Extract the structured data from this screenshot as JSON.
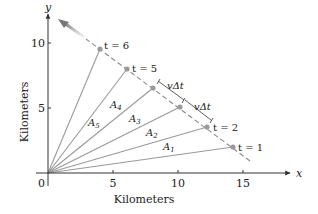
{
  "figure": {
    "x_axis": {
      "label": "Kilometers",
      "var": "x",
      "ticks": [
        "0",
        "5",
        "10",
        "15"
      ]
    },
    "y_axis": {
      "label": "Kilometers",
      "var": "y",
      "ticks": [
        "5",
        "10"
      ]
    },
    "points": [
      {
        "label": "t = 1"
      },
      {
        "label": "t = 2"
      },
      {
        "label": "t = 3"
      },
      {
        "label": "t = 4"
      },
      {
        "label": "t = 5"
      },
      {
        "label": "t = 6"
      }
    ],
    "areas": [
      {
        "name": "A",
        "sub": "1"
      },
      {
        "name": "A",
        "sub": "2"
      },
      {
        "name": "A",
        "sub": "3"
      },
      {
        "name": "A",
        "sub": "4"
      },
      {
        "name": "A",
        "sub": "5"
      }
    ],
    "displacement_labels": [
      "vΔt",
      "vΔt"
    ],
    "colors": {
      "axis": "#333333",
      "ray": "#9a9a9a",
      "path": "#8a8a8a",
      "point": "#9a9a9a",
      "arrow": "#777777"
    }
  }
}
